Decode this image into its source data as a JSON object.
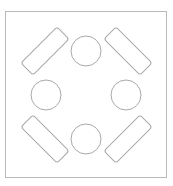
{
  "diagram": {
    "canvas": {
      "width": 173,
      "height": 186,
      "background_color": "#ffffff"
    },
    "frame": {
      "name": "outer-frame",
      "x": 5.5,
      "y": 11.5,
      "width": 161,
      "height": 166,
      "stroke_color": "#b9b9b9",
      "stroke_width": 1,
      "fill_color": "#ffffff"
    },
    "style": {
      "stroke_color": "#a9a9a9",
      "stroke_width": 1,
      "fill_color": "none"
    },
    "center": {
      "x": 86,
      "y": 95
    },
    "circles": [
      {
        "name": "circle-top",
        "position": "top",
        "cx": 86,
        "cy": 51,
        "r": 15
      },
      {
        "name": "circle-left",
        "position": "left",
        "cx": 46,
        "cy": 95,
        "r": 15
      },
      {
        "name": "circle-right",
        "position": "right",
        "cx": 126,
        "cy": 95,
        "r": 15
      },
      {
        "name": "circle-bottom",
        "position": "bottom",
        "cx": 86,
        "cy": 139,
        "r": 15
      }
    ],
    "rounded_rectangles": [
      {
        "name": "rect-top-left",
        "position": "top-left",
        "cx": 45,
        "cy": 51,
        "length": 51,
        "thickness": 17,
        "corner_radius": 3,
        "rotation_deg": -45
      },
      {
        "name": "rect-top-right",
        "position": "top-right",
        "cx": 128,
        "cy": 51,
        "length": 51,
        "thickness": 17,
        "corner_radius": 3,
        "rotation_deg": 45
      },
      {
        "name": "rect-bottom-left",
        "position": "bottom-left",
        "cx": 45,
        "cy": 139,
        "length": 51,
        "thickness": 17,
        "corner_radius": 3,
        "rotation_deg": 45
      },
      {
        "name": "rect-bottom-right",
        "position": "bottom-right",
        "cx": 128,
        "cy": 139,
        "length": 51,
        "thickness": 17,
        "corner_radius": 3,
        "rotation_deg": -45
      }
    ]
  }
}
